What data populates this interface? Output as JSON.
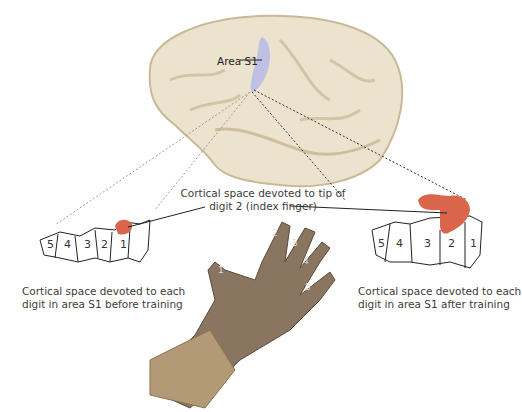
{
  "figure": {
    "brain_label": "Area S1",
    "tip_caption": {
      "line1": "Cortical space devoted to tip of",
      "line2": "digit 2 (index finger)"
    },
    "before_map": {
      "digits": [
        "5",
        "4",
        "3",
        "2",
        "1"
      ],
      "caption_line1": "Cortical space devoted to each",
      "caption_line2": "digit in area S1 before training"
    },
    "after_map": {
      "digits": [
        "5",
        "4",
        "3",
        "2",
        "1"
      ],
      "caption_line1": "Cortical space devoted to each",
      "caption_line2": "digit in area S1 after training"
    },
    "hand_digits": [
      "1",
      "2",
      "3",
      "4",
      "5"
    ],
    "colors": {
      "brain": "#ece3cf",
      "brain_shadow": "#c9b996",
      "area_s1": "#b9bde6",
      "digit2_highlight": "#d9664a",
      "hand": "#8a7560",
      "fur": "#b39a77"
    }
  }
}
